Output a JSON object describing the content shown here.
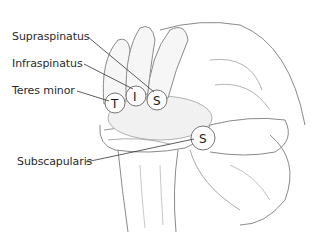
{
  "diagram": {
    "labels": [
      {
        "id": "supraspinatus",
        "text": "Supraspinatus",
        "x": 12,
        "y": 30,
        "tip": "S",
        "tip_x": 157,
        "tip_y": 100
      },
      {
        "id": "infraspinatus",
        "text": "Infraspinatus",
        "x": 12,
        "y": 57,
        "tip": "I",
        "tip_x": 136,
        "tip_y": 96
      },
      {
        "id": "teres-minor",
        "text": "Teres minor",
        "x": 12,
        "y": 84,
        "tip": "T",
        "tip_x": 115,
        "tip_y": 103
      },
      {
        "id": "subscapularis",
        "text": "Subscapularis",
        "x": 17,
        "y": 155,
        "tip": "S",
        "tip_x": 203,
        "tip_y": 138
      }
    ],
    "tips": {
      "t": "T",
      "i": "I",
      "s_top": "S",
      "s_bottom": "S"
    },
    "colors": {
      "line": "#333333",
      "sketch": "#8a8a8a",
      "shade": "#c8c8c8",
      "background": "#ffffff"
    }
  }
}
